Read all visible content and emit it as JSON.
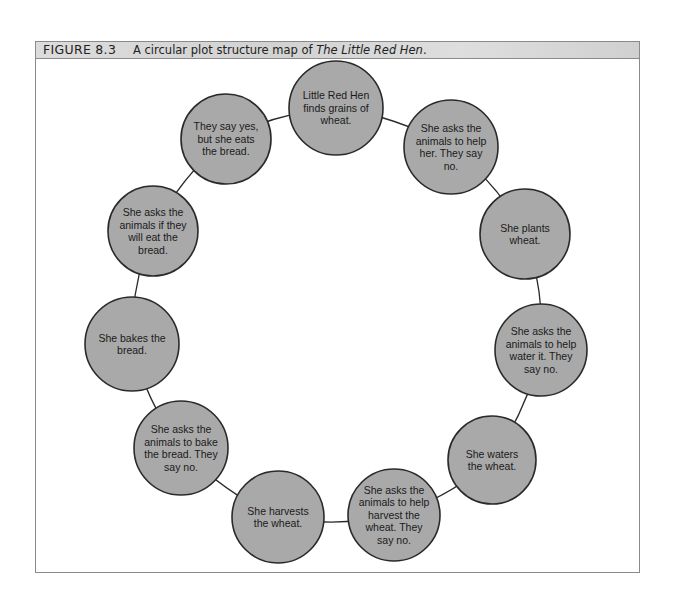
{
  "figure": {
    "label": "FIGURE 8.3",
    "caption_prefix": "A circular plot structure map of ",
    "caption_title": "The Little Red Hen",
    "caption_suffix": "."
  },
  "colors": {
    "circle_fill": "#a9a9a9",
    "circle_stroke": "#2a2a2a",
    "connector": "#2a2a2a",
    "header_bg": "#d9d9d9"
  },
  "nodes": [
    {
      "id": 1,
      "text": "Little Red Hen finds grains of wheat.",
      "cx": 336,
      "cy": 108,
      "r": 47
    },
    {
      "id": 2,
      "text": "She asks the animals to help her. They say no.",
      "cx": 451,
      "cy": 147,
      "r": 47
    },
    {
      "id": 3,
      "text": "She plants wheat.",
      "cx": 525,
      "cy": 234,
      "r": 45
    },
    {
      "id": 4,
      "text": "She asks the animals to help water it. They say no.",
      "cx": 541,
      "cy": 350,
      "r": 46
    },
    {
      "id": 5,
      "text": "She waters the wheat.",
      "cx": 492,
      "cy": 460,
      "r": 44
    },
    {
      "id": 6,
      "text": "She asks the animals to help harvest the wheat. They say no.",
      "cx": 394,
      "cy": 515,
      "r": 46
    },
    {
      "id": 7,
      "text": "She harvests the wheat.",
      "cx": 278,
      "cy": 517,
      "r": 46
    },
    {
      "id": 8,
      "text": "She asks the animals to bake the bread. They say no.",
      "cx": 181,
      "cy": 448,
      "r": 47
    },
    {
      "id": 9,
      "text": "She bakes the bread.",
      "cx": 132,
      "cy": 344,
      "r": 47
    },
    {
      "id": 10,
      "text": "She asks the animals if they will eat the bread.",
      "cx": 153,
      "cy": 231,
      "r": 45
    },
    {
      "id": 11,
      "text": "They say yes, but she eats the bread.",
      "cx": 226,
      "cy": 139,
      "r": 45
    }
  ]
}
